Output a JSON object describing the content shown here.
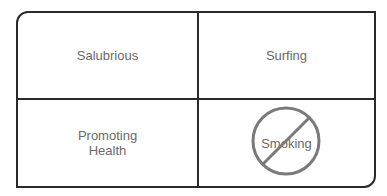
{
  "cells": {
    "top_left": "Salubrious",
    "top_right": "Surfing",
    "bottom_left": "Promoting\nHealth",
    "bottom_right": "Smoking"
  },
  "prohibited_symbol": {
    "icon": "no-symbol-icon",
    "applies_to": "Smoking",
    "color": "#7a7a7a"
  },
  "colors": {
    "border": "#2a2a2a",
    "text": "#6a6a6a"
  }
}
